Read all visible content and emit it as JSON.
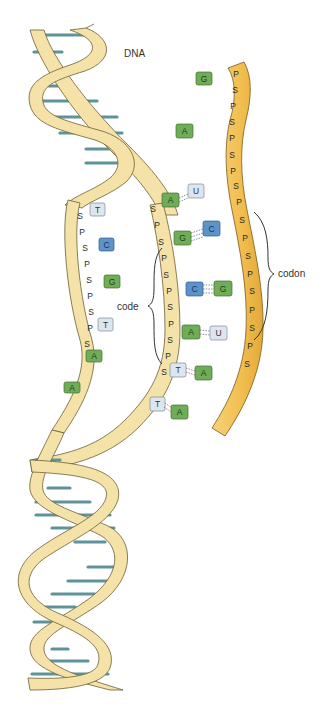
{
  "diagram": {
    "title_label": "DNA",
    "code_label": "code",
    "codon_label": "codon",
    "colors": {
      "dna_strand": "#f5e2a8",
      "dna_strand_outline": "#7a6a3a",
      "rungs": "#5e939a",
      "mrna_strand": "#f3c45a",
      "base_A_G": "#6fae57",
      "base_C": "#5c93c9",
      "base_T_U": "#dde6ee"
    },
    "mrna_strand": {
      "backbone": [
        "P",
        "S",
        "P",
        "S",
        "P",
        "S",
        "P",
        "S",
        "P",
        "S",
        "P",
        "S",
        "P",
        "S",
        "P",
        "S",
        "P",
        "S"
      ],
      "bases": [
        "G",
        "A",
        "U",
        "C",
        "G",
        "U",
        "A",
        "A"
      ]
    },
    "template_strand": {
      "backbone": [
        "S",
        "P",
        "S",
        "P",
        "S",
        "P",
        "S",
        "P",
        "S",
        "P",
        "S"
      ],
      "bases": [
        "A",
        "G",
        "C",
        "A",
        "T",
        "T"
      ]
    },
    "coding_strand": {
      "backbone": [
        "S",
        "P",
        "S",
        "P",
        "S",
        "P",
        "S",
        "P",
        "S"
      ],
      "bases": [
        "T",
        "C",
        "G",
        "T",
        "A",
        "A"
      ]
    },
    "pairs": [
      {
        "dna": "A",
        "rna": "U"
      },
      {
        "dna": "G",
        "rna": "C"
      },
      {
        "dna": "C",
        "rna": "G"
      },
      {
        "dna": "A",
        "rna": "U"
      },
      {
        "dna": "T",
        "rna": "A"
      },
      {
        "dna": "T",
        "rna": "A"
      }
    ]
  }
}
